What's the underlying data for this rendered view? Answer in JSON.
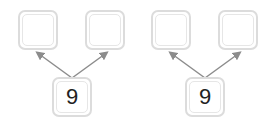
{
  "bonds": [
    {
      "whole": "9",
      "part_a": "",
      "part_b": ""
    },
    {
      "whole": "9",
      "part_a": "",
      "part_b": ""
    }
  ],
  "colors": {
    "box_border": "#dcdcdc",
    "arrow": "#8c8c8c",
    "text": "#222222"
  }
}
